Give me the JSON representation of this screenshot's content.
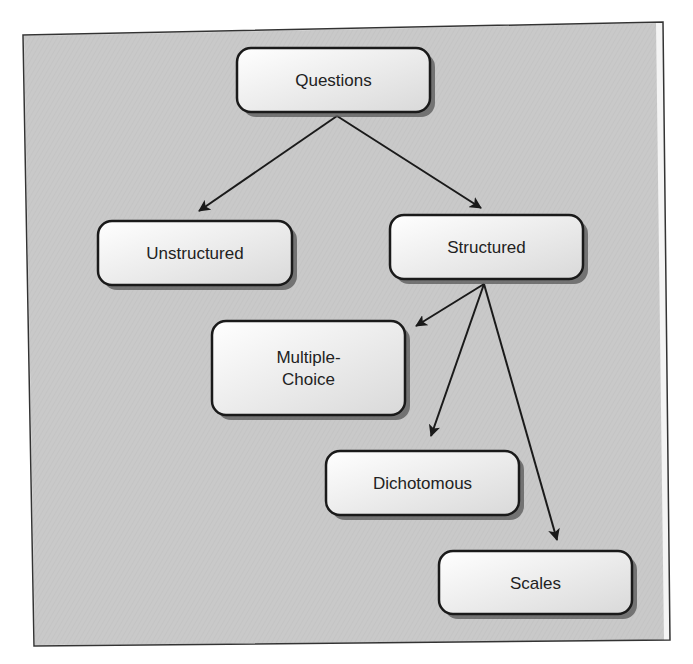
{
  "diagram": {
    "colors": {
      "page_background": "#ffffff",
      "panel_fill": "#c9c9c9",
      "panel_border": "#333333",
      "panel_inner_margin": "#f4f4f4",
      "node_fill_top": "#ffffff",
      "node_fill_bottom": "#d9d9d9",
      "node_border": "#1a1a1a",
      "node_shadow": "#555555",
      "arrow": "#1a1a1a",
      "text": "#222222"
    },
    "nodes": [
      {
        "id": "questions",
        "label": "Questions",
        "lines": [
          "Questions"
        ],
        "x": 237,
        "y": 48,
        "w": 193,
        "h": 64
      },
      {
        "id": "unstructured",
        "label": "Unstructured",
        "lines": [
          "Unstructured"
        ],
        "x": 98,
        "y": 221,
        "w": 194,
        "h": 64
      },
      {
        "id": "structured",
        "label": "Structured",
        "lines": [
          "Structured"
        ],
        "x": 390,
        "y": 215,
        "w": 193,
        "h": 64
      },
      {
        "id": "multiple-choice",
        "label": "Multiple-Choice",
        "lines": [
          "Multiple-",
          "Choice"
        ],
        "x": 212,
        "y": 321,
        "w": 193,
        "h": 94
      },
      {
        "id": "dichotomous",
        "label": "Dichotomous",
        "lines": [
          "Dichotomous"
        ],
        "x": 326,
        "y": 451,
        "w": 193,
        "h": 64
      },
      {
        "id": "scales",
        "label": "Scales",
        "lines": [
          "Scales"
        ],
        "x": 439,
        "y": 551,
        "w": 193,
        "h": 63
      }
    ],
    "edges": [
      {
        "from": "questions",
        "to": "unstructured",
        "x1": 337,
        "y1": 116,
        "x2": 199,
        "y2": 211
      },
      {
        "from": "questions",
        "to": "structured",
        "x1": 337,
        "y1": 116,
        "x2": 481,
        "y2": 208
      },
      {
        "from": "structured",
        "to": "multiple-choice",
        "x1": 484,
        "y1": 284,
        "x2": 416,
        "y2": 326
      },
      {
        "from": "structured",
        "to": "dichotomous",
        "x1": 484,
        "y1": 284,
        "x2": 431,
        "y2": 436
      },
      {
        "from": "structured",
        "to": "scales",
        "x1": 484,
        "y1": 284,
        "x2": 557,
        "y2": 540
      }
    ]
  }
}
